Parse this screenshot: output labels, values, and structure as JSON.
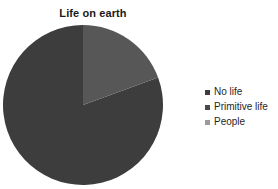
{
  "chart_data": {
    "type": "pie",
    "title": "Life on earth",
    "xlabel": "",
    "ylabel": "",
    "categories": [
      "No life",
      "Primitive life",
      "People"
    ],
    "values": [
      80.6,
      19.4,
      0.0
    ],
    "colors": [
      "#3d3d3d",
      "#575757",
      "#8c8c8c"
    ],
    "legend_position": "right",
    "grid": false,
    "start_angle_deg": 0,
    "direction": "counterclockwise"
  },
  "legend": {
    "entries": [
      {
        "label": "No life",
        "color": "#3d3d3d",
        "marker": "square-marker-icon"
      },
      {
        "label": "Primitive life",
        "color": "#4a4a4a",
        "marker": "square-marker-icon"
      },
      {
        "label": "People",
        "color": "#9a9a9a",
        "marker": "square-marker-icon"
      }
    ]
  },
  "canvas": {
    "background": "#ffffff",
    "pie_center_x": 83,
    "pie_center_y": 83,
    "pie_radius": 80
  }
}
